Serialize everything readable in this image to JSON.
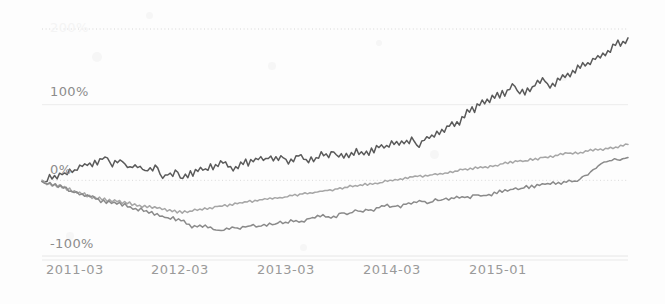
{
  "chart_data": {
    "type": "line",
    "title": "",
    "xlabel": "",
    "ylabel": "",
    "grid": true,
    "legend_position": "none",
    "ylim": [
      -100,
      200
    ],
    "ytick_labels": [
      "200%",
      "100%",
      "0%",
      -100
    ],
    "y_ticks": [
      200,
      100,
      0,
      -100
    ],
    "y_tick_text": {
      "t200": "200%",
      "t100": "100%",
      "t0": "0%",
      "tm100": "-100%"
    },
    "x_tick_labels": [
      "2011-03",
      "2012-03",
      "2013-03",
      "2014-03",
      "2015-01"
    ],
    "x_tick_values": [
      0,
      12,
      24,
      36,
      46
    ],
    "xlim": [
      0,
      48
    ],
    "colors": {
      "series_dark": "#5a5a5a",
      "series_mid": "#8a8a8a",
      "series_light": "#a6a6a6",
      "gridline": "#dcdcdc",
      "gridline_dotted": "#d8d8d8",
      "background": "#fdfdfd",
      "tick_text": "#919191"
    },
    "series": [
      {
        "name": "series-dark",
        "color": "#5a5a5a",
        "values": [
          0,
          2,
          -2,
          4,
          1,
          6,
          3,
          9,
          5,
          11,
          8,
          14,
          10,
          16,
          13,
          19,
          15,
          21,
          18,
          24,
          20,
          26,
          22,
          28,
          25,
          31,
          27,
          22,
          18,
          24,
          20,
          27,
          23,
          19,
          15,
          20,
          16,
          21,
          17,
          22,
          18,
          14,
          10,
          16,
          12,
          18,
          14,
          9,
          5,
          11,
          7,
          13,
          9,
          15,
          11,
          6,
          2,
          8,
          4,
          10,
          6,
          12,
          8,
          14,
          10,
          16,
          12,
          18,
          14,
          20,
          16,
          22,
          18,
          24,
          20,
          17,
          13,
          19,
          15,
          21,
          17,
          23,
          19,
          25,
          21,
          27,
          23,
          29,
          25,
          31,
          27,
          33,
          29,
          35,
          31,
          37,
          33,
          29,
          25,
          31,
          27,
          33,
          29,
          35,
          31,
          28,
          24,
          30,
          26,
          32,
          28,
          34,
          30,
          36,
          32,
          38,
          34,
          30,
          26,
          32,
          28,
          34,
          30,
          36,
          32,
          38,
          34,
          40,
          36,
          42,
          38,
          44,
          40,
          46,
          42,
          48,
          44,
          50,
          46,
          52,
          48,
          54,
          50,
          56,
          52,
          58,
          54,
          60,
          56,
          52,
          48,
          55,
          51,
          58,
          54,
          62,
          58,
          66,
          62,
          70,
          66,
          74,
          70,
          78,
          74,
          82,
          78,
          86,
          82,
          90,
          86,
          94,
          90,
          98,
          94,
          102,
          98,
          106,
          102,
          110,
          106,
          114,
          110,
          118,
          114,
          122,
          118,
          126,
          122,
          118,
          114,
          120,
          116,
          124,
          120,
          128,
          124,
          132,
          128,
          136,
          132,
          128,
          124,
          130,
          126,
          134,
          130,
          138,
          134,
          142,
          138,
          146,
          142,
          150,
          146,
          154,
          150,
          158,
          154,
          162,
          158,
          166,
          162,
          170,
          166,
          174,
          170,
          178,
          174,
          182,
          178,
          185,
          182,
          186
        ]
      },
      {
        "name": "series-light",
        "color": "#a6a6a6",
        "values": [
          0,
          -2,
          -5,
          -3,
          -7,
          -5,
          -9,
          -7,
          -11,
          -9,
          -13,
          -11,
          -15,
          -13,
          -17,
          -15,
          -19,
          -17,
          -21,
          -19,
          -23,
          -21,
          -25,
          -23,
          -27,
          -25,
          -28,
          -26,
          -29,
          -27,
          -30,
          -28,
          -31,
          -29,
          -32,
          -30,
          -33,
          -31,
          -34,
          -32,
          -35,
          -33,
          -36,
          -34,
          -37,
          -35,
          -38,
          -36,
          -39,
          -37,
          -40,
          -38,
          -41,
          -39,
          -42,
          -40,
          -43,
          -41,
          -42,
          -40,
          -41,
          -39,
          -40,
          -38,
          -39,
          -37,
          -38,
          -36,
          -37,
          -35,
          -36,
          -34,
          -35,
          -33,
          -34,
          -32,
          -33,
          -31,
          -32,
          -30,
          -31,
          -29,
          -30,
          -28,
          -29,
          -27,
          -28,
          -26,
          -27,
          -25,
          -26,
          -24,
          -25,
          -23,
          -24,
          -22,
          -23,
          -21,
          -22,
          -20,
          -21,
          -19,
          -20,
          -18,
          -19,
          -17,
          -18,
          -16,
          -17,
          -15,
          -16,
          -14,
          -15,
          -13,
          -14,
          -12,
          -13,
          -11,
          -12,
          -10,
          -11,
          -9,
          -10,
          -8,
          -9,
          -7,
          -8,
          -6,
          -7,
          -5,
          -6,
          -4,
          -5,
          -3,
          -4,
          -2,
          -3,
          -1,
          -2,
          0,
          -1,
          1,
          0,
          2,
          1,
          3,
          2,
          4,
          3,
          5,
          4,
          6,
          5,
          7,
          6,
          8,
          7,
          9,
          8,
          10,
          9,
          11,
          10,
          12,
          11,
          13,
          12,
          14,
          13,
          15,
          14,
          16,
          15,
          17,
          16,
          18,
          17,
          19,
          18,
          20,
          19,
          21,
          20,
          22,
          21,
          23,
          22,
          24,
          23,
          25,
          24,
          26,
          25,
          27,
          26,
          28,
          27,
          29,
          28,
          30,
          29,
          31,
          30,
          32,
          31,
          33,
          32,
          34,
          33,
          35,
          34,
          36,
          35,
          37,
          36,
          38,
          37,
          39,
          38,
          40,
          39,
          41,
          40,
          42,
          41,
          43,
          42,
          44,
          43,
          45,
          44,
          46,
          45,
          47,
          46
        ]
      },
      {
        "name": "series-mid",
        "color": "#8a8a8a",
        "values": [
          0,
          -3,
          -6,
          -4,
          -8,
          -6,
          -10,
          -8,
          -12,
          -10,
          -14,
          -12,
          -16,
          -14,
          -18,
          -16,
          -20,
          -18,
          -22,
          -20,
          -24,
          -22,
          -26,
          -24,
          -28,
          -26,
          -30,
          -28,
          -32,
          -30,
          -34,
          -32,
          -36,
          -34,
          -38,
          -36,
          -40,
          -38,
          -42,
          -40,
          -44,
          -42,
          -46,
          -44,
          -48,
          -46,
          -50,
          -48,
          -52,
          -50,
          -54,
          -52,
          -56,
          -54,
          -58,
          -56,
          -60,
          -58,
          -62,
          -60,
          -64,
          -62,
          -66,
          -64,
          -68,
          -66,
          -68,
          -66,
          -67,
          -65,
          -66,
          -64,
          -65,
          -63,
          -64,
          -62,
          -63,
          -61,
          -62,
          -60,
          -61,
          -59,
          -60,
          -58,
          -59,
          -57,
          -58,
          -56,
          -57,
          -55,
          -56,
          -54,
          -55,
          -53,
          -54,
          -52,
          -53,
          -51,
          -52,
          -50,
          -51,
          -49,
          -50,
          -48,
          -49,
          -47,
          -48,
          -46,
          -47,
          -45,
          -46,
          -44,
          -45,
          -43,
          -44,
          -42,
          -43,
          -41,
          -42,
          -40,
          -41,
          -39,
          -40,
          -38,
          -39,
          -37,
          -38,
          -36,
          -37,
          -35,
          -36,
          -34,
          -35,
          -33,
          -34,
          -32,
          -33,
          -31,
          -32,
          -30,
          -31,
          -29,
          -30,
          -28,
          -29,
          -27,
          -28,
          -26,
          -27,
          -25,
          -26,
          -24,
          -25,
          -23,
          -24,
          -22,
          -23,
          -21,
          -22,
          -20,
          -21,
          -19,
          -20,
          -18,
          -19,
          -17,
          -18,
          -16,
          -17,
          -15,
          -16,
          -14,
          -15,
          -13,
          -14,
          -12,
          -13,
          -11,
          -12,
          -10,
          -11,
          -9,
          -10,
          -8,
          -9,
          -7,
          -8,
          -6,
          -7,
          -5,
          -6,
          -4,
          -5,
          -3,
          -4,
          -2,
          -3,
          -1,
          -2,
          0,
          1,
          3,
          5,
          7,
          9,
          11,
          13,
          15,
          17,
          19,
          21,
          23,
          25,
          27,
          29,
          28,
          26,
          28,
          30,
          29
        ]
      }
    ]
  }
}
